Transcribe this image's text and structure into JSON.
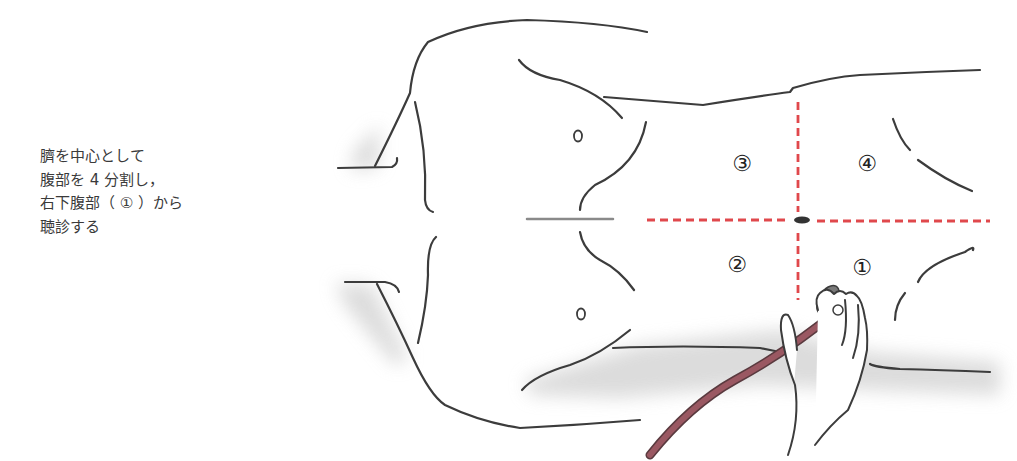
{
  "caption": {
    "lines": [
      "臍を中心として",
      "腹部を 4 分割し，",
      "右下腹部（ ① ）から",
      "聴診する"
    ]
  },
  "figure": {
    "quadrant_labels": {
      "q1": "①",
      "q2": "②",
      "q3": "③",
      "q4": "④"
    },
    "colors": {
      "outline": "#3c3c3c",
      "divider": "#e0484c",
      "tube": "#8a4a54",
      "shadow": "#d9d9d9"
    }
  }
}
